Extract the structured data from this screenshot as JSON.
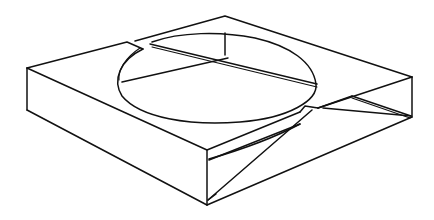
{
  "figure": {
    "stroke_color": "#111111",
    "background_color": "#ffffff",
    "width": 434,
    "height": 220
  }
}
